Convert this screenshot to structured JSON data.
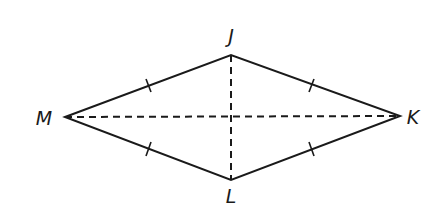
{
  "diagram": {
    "type": "rhombus",
    "vertices": {
      "M": {
        "label": "M",
        "x": 65,
        "y": 117
      },
      "J": {
        "label": "J",
        "x": 231,
        "y": 55
      },
      "K": {
        "label": "K",
        "x": 400,
        "y": 116
      },
      "L": {
        "label": "L",
        "x": 231,
        "y": 180
      }
    },
    "sides": [
      "MJ",
      "JK",
      "KL",
      "LM"
    ],
    "congruence_marks": "single tick on each side",
    "diagonals": [
      "JL (dashed)",
      "MK (dashed)"
    ],
    "colors": {
      "stroke": "#1a1a1a",
      "background": "#ffffff"
    }
  }
}
